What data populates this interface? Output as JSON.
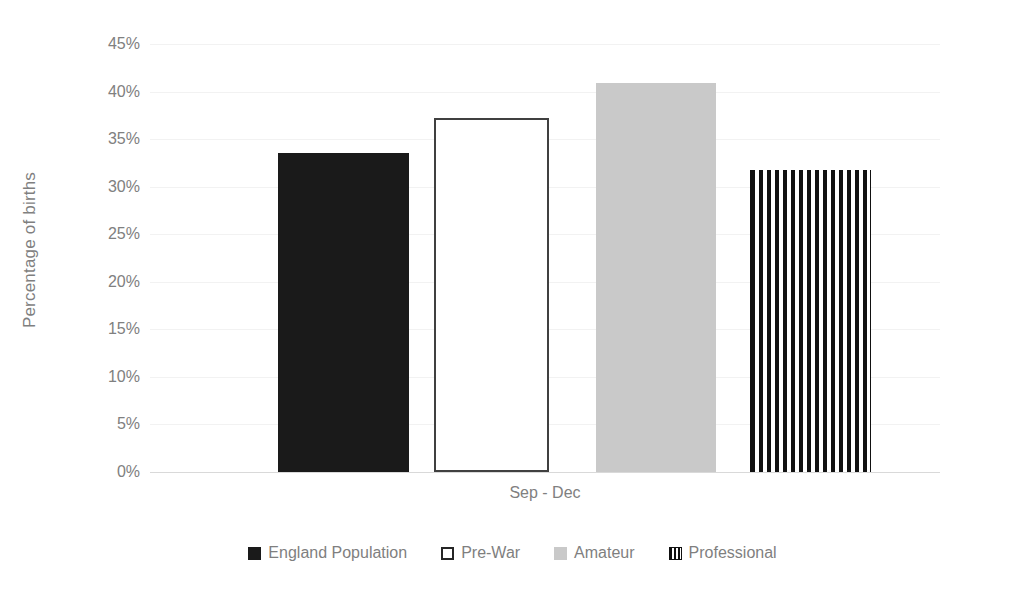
{
  "chart_data": {
    "type": "bar",
    "title": "",
    "xlabel": "",
    "ylabel": "Percentage of births",
    "categories": [
      "Sep - Dec"
    ],
    "ylim": [
      0,
      45
    ],
    "ytick_labels": [
      "45%",
      "40%",
      "35%",
      "30%",
      "25%",
      "20%",
      "15%",
      "10%",
      "5%",
      "0%"
    ],
    "ytick_values": [
      45,
      40,
      35,
      30,
      25,
      20,
      15,
      10,
      5,
      0
    ],
    "grid": true,
    "legend_position": "bottom",
    "series": [
      {
        "name": "England Population",
        "values": [
          33.5
        ],
        "style": "solid-black",
        "color": "#1a1a1a"
      },
      {
        "name": "Pre-War",
        "values": [
          37.2
        ],
        "style": "outline-white",
        "color": "#ffffff"
      },
      {
        "name": "Amateur",
        "values": [
          40.9
        ],
        "style": "solid-gray",
        "color": "#c9c9c9"
      },
      {
        "name": "Professional",
        "values": [
          31.8
        ],
        "style": "vertical-stripes",
        "color": "#111111"
      }
    ]
  },
  "axis": {
    "y_title": "Percentage of births",
    "ticks": [
      {
        "label": "45%"
      },
      {
        "label": "40%"
      },
      {
        "label": "35%"
      },
      {
        "label": "30%"
      },
      {
        "label": "25%"
      },
      {
        "label": "20%"
      },
      {
        "label": "15%"
      },
      {
        "label": "10%"
      },
      {
        "label": "5%"
      },
      {
        "label": "0%"
      }
    ],
    "category_label": "Sep - Dec"
  },
  "legend": {
    "items": [
      {
        "label": "England Population"
      },
      {
        "label": "Pre-War"
      },
      {
        "label": "Amateur"
      },
      {
        "label": "Professional"
      }
    ]
  }
}
